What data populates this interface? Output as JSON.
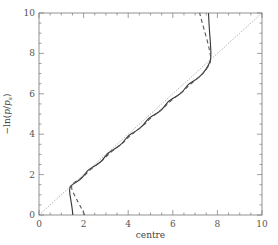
{
  "chart_data": {
    "type": "line",
    "title": "",
    "xlabel": "centre",
    "ylabel": "-ln(p/p_s)",
    "ylabel_parts": {
      "prefix": "−ln(",
      "p": "p",
      "slash": "/",
      "ps": "p",
      "sub": "s",
      "suffix": ")"
    },
    "xlim": [
      0,
      10
    ],
    "ylim": [
      0,
      10
    ],
    "xticks": [
      0,
      2,
      4,
      6,
      8,
      10
    ],
    "yticks": [
      0,
      2,
      4,
      6,
      8,
      10
    ],
    "minor_tick_step": 0.5,
    "grid": false,
    "legend": null,
    "series": [
      {
        "name": "solid",
        "style": "solid",
        "color": "#333333",
        "points": [
          [
            1.52,
            0.0
          ],
          [
            1.48,
            0.4
          ],
          [
            1.42,
            0.8
          ],
          [
            1.36,
            1.2
          ],
          [
            1.4,
            1.45
          ],
          [
            1.7,
            1.65
          ],
          [
            1.95,
            1.85
          ],
          [
            2.2,
            2.25
          ],
          [
            2.55,
            2.45
          ],
          [
            2.85,
            2.7
          ],
          [
            3.1,
            3.1
          ],
          [
            3.45,
            3.3
          ],
          [
            3.75,
            3.55
          ],
          [
            4.0,
            3.95
          ],
          [
            4.35,
            4.15
          ],
          [
            4.65,
            4.4
          ],
          [
            4.9,
            4.8
          ],
          [
            5.25,
            5.0
          ],
          [
            5.55,
            5.25
          ],
          [
            5.8,
            5.65
          ],
          [
            6.15,
            5.85
          ],
          [
            6.45,
            6.1
          ],
          [
            6.7,
            6.5
          ],
          [
            7.05,
            6.7
          ],
          [
            7.35,
            7.0
          ],
          [
            7.6,
            7.4
          ],
          [
            7.72,
            7.75
          ],
          [
            7.7,
            8.3
          ],
          [
            7.65,
            9.0
          ],
          [
            7.6,
            10.0
          ]
        ]
      },
      {
        "name": "dashed",
        "style": "dashed",
        "color": "#555555",
        "points": [
          [
            2.05,
            0.0
          ],
          [
            1.85,
            0.45
          ],
          [
            1.6,
            0.95
          ],
          [
            1.4,
            1.45
          ],
          [
            1.7,
            1.7
          ],
          [
            2.0,
            1.9
          ],
          [
            2.25,
            2.2
          ],
          [
            2.6,
            2.5
          ],
          [
            2.9,
            2.75
          ],
          [
            3.15,
            3.05
          ],
          [
            3.5,
            3.35
          ],
          [
            3.8,
            3.6
          ],
          [
            4.05,
            3.9
          ],
          [
            4.4,
            4.2
          ],
          [
            4.7,
            4.45
          ],
          [
            4.95,
            4.75
          ],
          [
            5.3,
            5.05
          ],
          [
            5.6,
            5.3
          ],
          [
            5.85,
            5.6
          ],
          [
            6.2,
            5.9
          ],
          [
            6.5,
            6.15
          ],
          [
            6.75,
            6.45
          ],
          [
            7.1,
            6.75
          ],
          [
            7.4,
            7.05
          ],
          [
            7.65,
            7.45
          ],
          [
            7.72,
            7.75
          ],
          [
            7.6,
            8.4
          ],
          [
            7.4,
            9.2
          ],
          [
            7.2,
            10.0
          ]
        ]
      },
      {
        "name": "diagonal",
        "style": "dotted",
        "color": "#888888",
        "points": [
          [
            0,
            0
          ],
          [
            10,
            10
          ]
        ]
      }
    ]
  },
  "plot_box": {
    "left": 39,
    "top": 13,
    "right": 262,
    "bottom": 215
  }
}
